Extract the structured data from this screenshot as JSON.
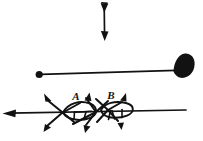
{
  "figure": {
    "background_color": "#ffffff",
    "ink_color": "#121212",
    "width": 203,
    "height": 141
  },
  "annotations": {
    "label_a": "A",
    "label_b": "B"
  },
  "elements": {
    "vertical_double_arrow": {
      "name": "vertical-double-arrow",
      "description": "Vertical shaft with a downward arrowhead at the top end and a downward arrowhead at the bottom end",
      "x": 104,
      "y_top": 4,
      "y_bottom": 40
    },
    "horizontal_pin": {
      "name": "horizontal-pin-line",
      "description": "Long horizontal shaft with a filled round dot on the left terminus and a solid fan/teardrop blade on the right terminus",
      "y": 74,
      "x_left": 39,
      "x_right": 188
    },
    "dot_terminus": {
      "name": "filled-dot-terminus",
      "cx": 39,
      "cy": 74,
      "r": 3.4
    },
    "blade_terminus": {
      "name": "solid-blade-terminus",
      "cx": 185,
      "cy": 69
    },
    "baseline_arrow": {
      "name": "leftward-baseline-arrow",
      "description": "Long horizontal line crossing the lower assembly, terminating in a leftward arrowhead at the left margin",
      "y": 113,
      "x_left": 3,
      "x_right": 186
    },
    "leaf_a": {
      "name": "leaf-shape-a",
      "description": "Pointed-oval leaf outline with internal vein strokes, labelled A",
      "cx": 79,
      "cy": 112
    },
    "leaf_b": {
      "name": "leaf-shape-b",
      "description": "Pointed-oval leaf outline with internal vein strokes, labelled B",
      "cx": 113,
      "cy": 110
    },
    "radiating_arrows": {
      "name": "radiating-arrow-group",
      "description": "Six short arrows radiating up-left, up-right and down-left, down-right from the two crossing junctions",
      "count": 6
    }
  }
}
